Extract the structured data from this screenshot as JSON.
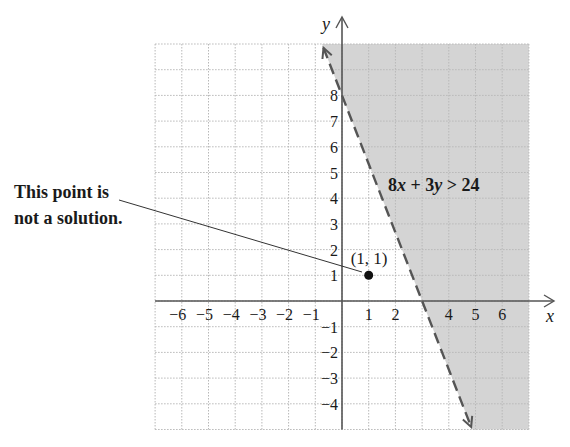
{
  "chart_data": {
    "type": "inequality-graph",
    "inequality": "8x + 3y > 24",
    "boundary_line": {
      "equation": "8x + 3y = 24",
      "style": "dashed",
      "points": [
        [
          0,
          8
        ],
        [
          3,
          0
        ]
      ]
    },
    "shaded_region": "right of / above boundary line",
    "xlim": [
      -7,
      7
    ],
    "ylim": [
      -5,
      10
    ],
    "x_tick_labels": [
      "−6",
      "−5",
      "−4",
      "−3",
      "−2",
      "−1",
      "1",
      "2",
      "4",
      "5",
      "6"
    ],
    "x_tick_values": [
      -6,
      -5,
      -4,
      -3,
      -2,
      -1,
      1,
      2,
      4,
      5,
      6
    ],
    "y_tick_labels": [
      "8",
      "7",
      "6",
      "5",
      "4",
      "3",
      "2",
      "1",
      "−1",
      "−2",
      "−3",
      "−4"
    ],
    "y_tick_values": [
      8,
      7,
      6,
      5,
      4,
      3,
      2,
      1,
      -1,
      -2,
      -3,
      -4
    ],
    "xlabel": "x",
    "ylabel": "y",
    "grid": true,
    "test_point": {
      "x": 1,
      "y": 1,
      "label": "(1, 1)"
    }
  },
  "annotation": {
    "line1": "This point is",
    "line2": "not a solution."
  },
  "labels": {
    "inequality_text_a": "8",
    "inequality_text_x": "x",
    "inequality_text_b": " + 3",
    "inequality_text_y": "y",
    "inequality_text_c": " > 24",
    "point_label": "(1, 1)",
    "x_axis": "x",
    "y_axis": "y"
  },
  "colors": {
    "shade": "#d4d4d4",
    "grid": "#b8b8b8",
    "axis": "#555555",
    "line": "#555555",
    "text": "#1a1a1a"
  }
}
